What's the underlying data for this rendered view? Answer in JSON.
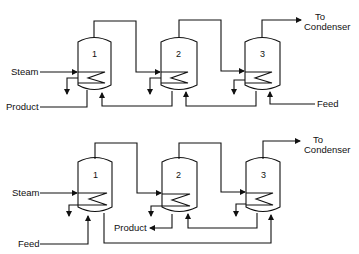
{
  "diagram": {
    "type": "process-flow",
    "panels": [
      {
        "id": "forward-feed-top",
        "effects": [
          "1",
          "2",
          "3"
        ],
        "labels": {
          "steam": "Steam",
          "product": "Product",
          "feed": "Feed",
          "condenser_line1": "To",
          "condenser_line2": "Condenser"
        }
      },
      {
        "id": "mixed-feed-bottom",
        "effects": [
          "1",
          "2",
          "3"
        ],
        "labels": {
          "steam": "Steam",
          "product": "Product",
          "feed": "Feed",
          "condenser_line1": "To",
          "condenser_line2": "Condenser"
        }
      }
    ]
  }
}
